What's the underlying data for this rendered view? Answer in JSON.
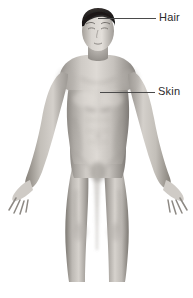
{
  "illustration": {
    "title": "Anterior view of human body",
    "subject": "male human figure, front view, arms slightly abducted, palms forward",
    "style": "grayscale pencil / airbrush medical illustration",
    "background_color": "#ffffff",
    "hair_color": "#2a2623",
    "skin_tone_light": "#d8d4cf",
    "skin_tone_mid": "#a9a5a0",
    "skin_tone_shadow": "#6e6a66",
    "crop_note": "figure cropped below the knees at the bottom edge"
  },
  "callouts": [
    {
      "id": "hair",
      "label": "Hair",
      "target": "scalp hair on top of head",
      "leader_line_color": "#4a4a4a"
    },
    {
      "id": "skin",
      "label": "Skin",
      "target": "right pectoral / chest surface",
      "leader_line_color": "#4a4a4a"
    }
  ],
  "text_color": "#2b2b2b"
}
